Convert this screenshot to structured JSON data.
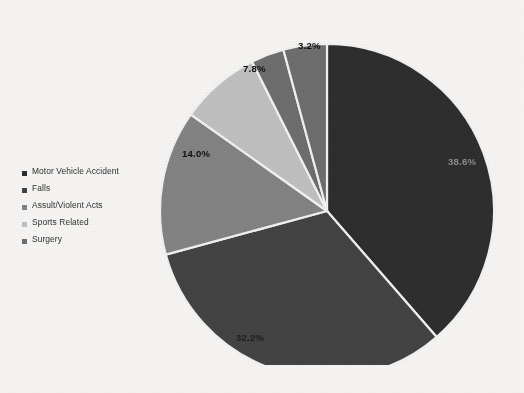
{
  "chart_data": {
    "type": "pie",
    "title": "",
    "categories": [
      "Motor Vehicle Accident",
      "Falls",
      "Assult/Violent Acts",
      "Sports Related",
      "Surgery"
    ],
    "values": [
      38.6,
      32.2,
      14.0,
      7.8,
      3.2
    ],
    "value_labels": [
      "38.6%",
      "32.2%",
      "14.0%",
      "7.8%",
      "3.2%"
    ],
    "colors": [
      "#2e2e2e",
      "#434343",
      "#838383",
      "#c0c0c0",
      "#6e6e6e"
    ],
    "legend_position": "left",
    "units": "percent",
    "start_angle_deg": 0,
    "direction": "clockwise",
    "slice_border_color": "#f2f1ef"
  },
  "legend": {
    "items": [
      {
        "label": "Motor Vehicle Accident",
        "color": "#2e2e2e"
      },
      {
        "label": "Falls",
        "color": "#434343"
      },
      {
        "label": "Assult/Violent Acts",
        "color": "#838383"
      },
      {
        "label": "Sports Related",
        "color": "#c0c0c0"
      },
      {
        "label": "Surgery",
        "color": "#6e6e6e"
      }
    ]
  },
  "slice_labels": {
    "s0": "38.6%",
    "s1": "32.2%",
    "s2": "14.0%",
    "s3": "7.8%",
    "s4": "3.2%"
  },
  "canvas": {
    "background": "#f6f5f3"
  }
}
